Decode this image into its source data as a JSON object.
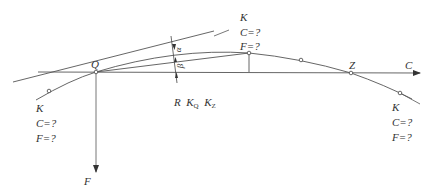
{
  "diagram": {
    "colors": {
      "line": "#555555",
      "text": "#333333",
      "background": "#ffffff"
    },
    "points": {
      "origin": "Q",
      "end": "Z"
    },
    "axes": {
      "horizontal": "C",
      "vertical": "F"
    },
    "angles": {
      "upper": "α",
      "lower": "β"
    },
    "center_labels": {
      "r": "R",
      "kq": "K",
      "kq_sub": "Q",
      "kz": "K",
      "kz_sub": "Z"
    },
    "callouts": [
      {
        "id": "top",
        "k": "K",
        "c": "C=?",
        "f": "F=?"
      },
      {
        "id": "left",
        "k": "K",
        "c": "C=?",
        "f": "F=?"
      },
      {
        "id": "right",
        "k": "K",
        "c": "C=?",
        "f": "F=?"
      }
    ]
  }
}
